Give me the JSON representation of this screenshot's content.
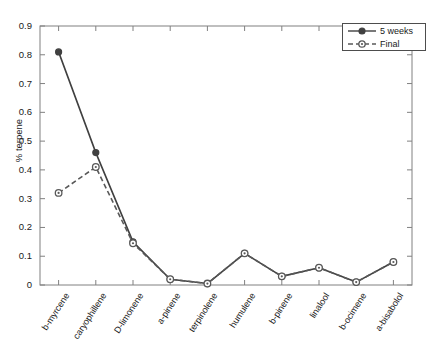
{
  "chart_data": {
    "type": "line",
    "title": "",
    "xlabel": "",
    "ylabel": "% terpene",
    "categories": [
      "b-myrcene",
      "caryophillene",
      "D-limonene",
      "a-pinene",
      "terpinolene",
      "humulene",
      "b-pinene",
      "linalool",
      "b-ocimene",
      "a-bisabolol"
    ],
    "series": [
      {
        "name": "5 weeks",
        "values": [
          0.81,
          0.46,
          0.15,
          0.02,
          0.005,
          0.11,
          0.03,
          0.06,
          0.01,
          0.08
        ],
        "color": "#404040",
        "linestyle": "solid",
        "marker": "filled-circle"
      },
      {
        "name": "Final",
        "values": [
          0.32,
          0.41,
          0.145,
          0.02,
          0.005,
          0.11,
          0.03,
          0.06,
          0.01,
          0.08
        ],
        "color": "#595959",
        "linestyle": "dashed",
        "marker": "open-circle"
      }
    ],
    "ylim": [
      0,
      0.9
    ],
    "yticks": [
      "0",
      "0.1",
      "0.2",
      "0.3",
      "0.4",
      "0.5",
      "0.6",
      "0.7",
      "0.8",
      "0.9"
    ],
    "ytick_values": [
      0,
      0.1,
      0.2,
      0.3,
      0.4,
      0.5,
      0.6,
      0.7,
      0.8,
      0.9
    ],
    "grid": false,
    "legend_position": "top-right",
    "legend_entries": [
      "5 weeks",
      "Final"
    ]
  }
}
